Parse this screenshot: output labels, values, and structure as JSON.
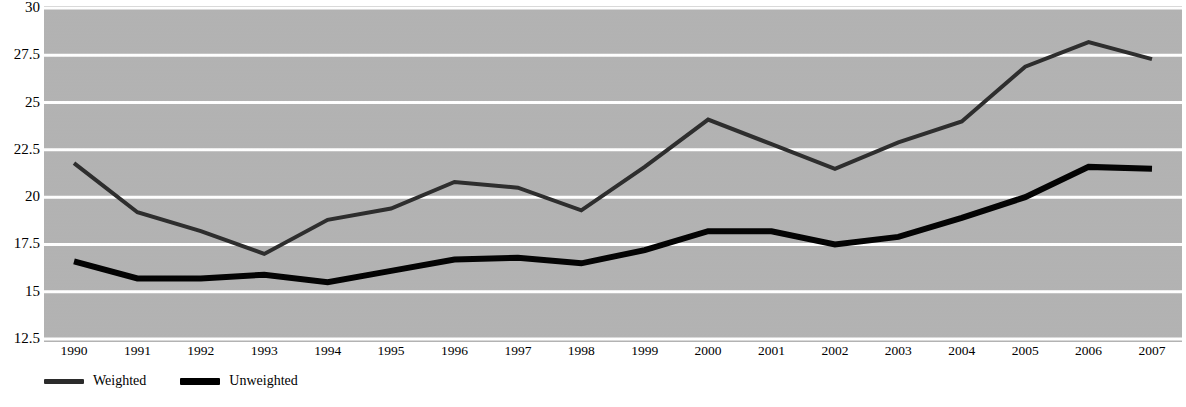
{
  "chart_data": {
    "type": "line",
    "title": "",
    "subtitle": "",
    "xlabel": "",
    "ylabel": "",
    "x": [
      1990,
      1991,
      1992,
      1993,
      1994,
      1995,
      1996,
      1997,
      1998,
      1999,
      2000,
      2001,
      2002,
      2003,
      2004,
      2005,
      2006,
      2007
    ],
    "categories": [
      "1990",
      "1991",
      "1992",
      "1993",
      "1994",
      "1995",
      "1996",
      "1997",
      "1998",
      "1999",
      "2000",
      "2001",
      "2002",
      "2003",
      "2004",
      "2005",
      "2006",
      "2007"
    ],
    "series": [
      {
        "name": "Weighted",
        "color": "#2b2b2b",
        "line_width": 4,
        "values": [
          21.8,
          19.2,
          18.2,
          17.0,
          18.8,
          19.4,
          20.8,
          20.5,
          19.3,
          21.6,
          24.1,
          22.8,
          21.5,
          22.9,
          24.0,
          26.9,
          28.2,
          27.3
        ]
      },
      {
        "name": "Unweighted",
        "color": "#000000",
        "line_width": 6,
        "values": [
          16.6,
          15.7,
          15.7,
          15.9,
          15.5,
          16.1,
          16.7,
          16.8,
          16.5,
          17.2,
          18.2,
          18.2,
          17.5,
          17.9,
          18.9,
          20.0,
          21.6,
          21.5
        ]
      }
    ],
    "ylim": [
      12.5,
      30
    ],
    "yticks": [
      30,
      27.5,
      25,
      22.5,
      20,
      17.5,
      15,
      12.5
    ],
    "ytick_labels": [
      "30",
      "27.5",
      "25",
      "22.5",
      "20",
      "17.5",
      "15",
      "12.5"
    ],
    "grid": true,
    "grid_color": "#ffffff",
    "plot_background": "#b2b2b2",
    "figure_background": "#ffffff",
    "legend_position": "bottom-left"
  },
  "legend": {
    "items": [
      {
        "label": "Weighted",
        "swatch": "weighted-line-swatch"
      },
      {
        "label": "Unweighted",
        "swatch": "unweighted-line-swatch"
      }
    ]
  }
}
